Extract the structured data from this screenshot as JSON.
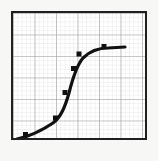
{
  "figure": {
    "kind": "graph-paper-plot",
    "width": 158,
    "height": 161,
    "background_color": "#f7f7f5",
    "caption": ""
  },
  "plot_area": {
    "left": 11,
    "top": 11,
    "width": 136,
    "height": 129,
    "border_color": "#231f20",
    "border_width": 2,
    "fill_color": "#ffffff"
  },
  "grid": {
    "visible": true,
    "minor": {
      "visible": true,
      "color": "#d9d9d9",
      "width": 0.6,
      "spacing_x": 4.3,
      "spacing_y": 4.3,
      "count_x": 31,
      "count_y": 29
    },
    "major": {
      "visible": true,
      "color": "#9a9a9a",
      "width": 1.1,
      "spacing_x": 21.5,
      "spacing_y": 21.5,
      "count_x": 6,
      "count_y": 6
    }
  },
  "chart_data": {
    "type": "line",
    "title": "",
    "subtitle": "",
    "xlabel": "",
    "ylabel": "",
    "xlim": [
      0,
      100
    ],
    "ylim": [
      0,
      100
    ],
    "xticks": [],
    "yticks": [],
    "xticklabels": [],
    "yticklabels": [],
    "grid": true,
    "legend": false,
    "legend_position": "none",
    "annotations": [],
    "series": [
      {
        "name": "sigmoid-curve",
        "shape": "s-curve",
        "color": "#111111",
        "line_width": 3.2,
        "line_style": "solid",
        "marker": "square",
        "marker_size": 5,
        "marker_color": "#111111",
        "x": [
          11,
          33,
          40,
          46,
          50,
          69
        ],
        "y": [
          8,
          23,
          42,
          62,
          73,
          85
        ],
        "points_px": [
          {
            "x": 14.5,
            "y": 123.5
          },
          {
            "x": 44.5,
            "y": 107.0
          },
          {
            "x": 54.0,
            "y": 81.5
          },
          {
            "x": 62.5,
            "y": 57.5
          },
          {
            "x": 68.0,
            "y": 43.0
          },
          {
            "x": 93.0,
            "y": 35.5
          }
        ],
        "path_px": "M 4 126 C 14 124 28 118 40 110 C 48 104 52 94 56 80 C 60 64 64 52 70 45 C 78 37 86 35 95 35 L 112 34"
      }
    ]
  }
}
